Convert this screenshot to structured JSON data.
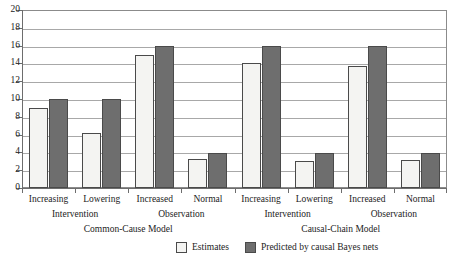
{
  "chart_data": {
    "type": "bar",
    "title": "",
    "subtitle": "",
    "xlabel": "",
    "ylabel": "",
    "ylim": [
      0,
      20
    ],
    "yticks": [
      0,
      2,
      4,
      6,
      8,
      10,
      12,
      14,
      16,
      18,
      20
    ],
    "grid": true,
    "legend_position": "bottom-center",
    "categories": [
      "Increasing",
      "Lowering",
      "Increased",
      "Normal",
      "Increasing",
      "Lowering",
      "Increased",
      "Normal"
    ],
    "group_labels": [
      "Intervention",
      "Observation",
      "Intervention",
      "Observation"
    ],
    "panel_labels": [
      "Common-Cause Model",
      "Causal-Chain Model"
    ],
    "series": [
      {
        "name": "Estimates",
        "color": "#f4f4f2",
        "values": [
          9.0,
          6.2,
          15.0,
          3.3,
          14.0,
          3.0,
          13.7,
          3.2
        ]
      },
      {
        "name": "Predicted by causal Bayes nets",
        "color": "#6e6e6e",
        "values": [
          10.0,
          10.0,
          16.0,
          3.9,
          16.0,
          3.9,
          16.0,
          3.9
        ]
      }
    ]
  },
  "legend": {
    "entries": [
      {
        "label": "Estimates",
        "swatch": "estimates"
      },
      {
        "label": "Predicted by causal Bayes nets",
        "swatch": "predicted"
      }
    ]
  }
}
